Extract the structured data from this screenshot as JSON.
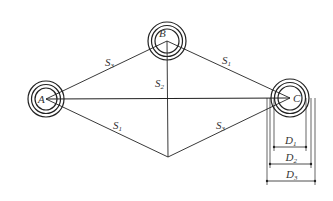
{
  "diagram": {
    "nodes": [
      {
        "id": "A",
        "label": "A",
        "x": 46,
        "y": 99,
        "radii": [
          11,
          14.5,
          18
        ]
      },
      {
        "id": "B",
        "label": "B",
        "x": 167,
        "y": 41,
        "radii": [
          12,
          15.5,
          19
        ]
      },
      {
        "id": "C",
        "label": "C",
        "x": 290,
        "y": 98,
        "radii": [
          12,
          15.5,
          19
        ]
      }
    ],
    "bottom_point": {
      "x": 168,
      "y": 157
    },
    "edge_labels": [
      {
        "main": "S",
        "sub": "3",
        "x": 105,
        "y": 66
      },
      {
        "main": "S",
        "sub": "2",
        "x": 155,
        "y": 87
      },
      {
        "main": "S",
        "sub": "1",
        "x": 222,
        "y": 64
      },
      {
        "main": "S",
        "sub": "1",
        "x": 113,
        "y": 129
      },
      {
        "main": "S",
        "sub": "3",
        "x": 216,
        "y": 129
      }
    ],
    "dimensions": [
      {
        "main": "D",
        "sub": "1",
        "x1": 274,
        "x2": 306,
        "y": 147
      },
      {
        "main": "D",
        "sub": "2",
        "x1": 270,
        "x2": 311,
        "y": 164
      },
      {
        "main": "D",
        "sub": "3",
        "x1": 267,
        "x2": 315,
        "y": 181
      }
    ],
    "colors": {
      "stroke": "#222222",
      "text": "#333333",
      "background": "#ffffff"
    }
  }
}
